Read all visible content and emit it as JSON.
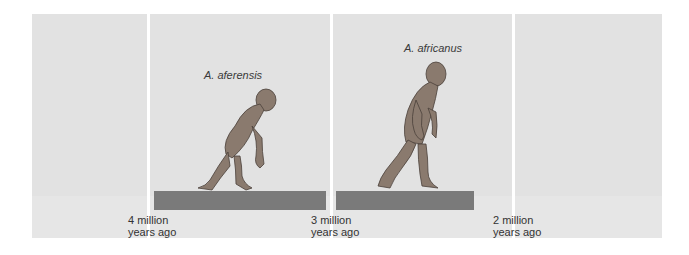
{
  "timeline": {
    "ticks": [
      {
        "line1": "4 million",
        "line2": "years ago"
      },
      {
        "line1": "3 million",
        "line2": "years ago"
      },
      {
        "line1": "2 million",
        "line2": "years ago"
      }
    ],
    "species": [
      {
        "name": "A. aferensis",
        "start_mya": 4.0,
        "end_mya": 3.0
      },
      {
        "name": "A. africanus",
        "start_mya": 3.0,
        "end_mya": 2.2
      }
    ],
    "colors": {
      "background": "#e2e2e2",
      "bar": "#7a7a7a",
      "divider": "#ffffff"
    }
  }
}
